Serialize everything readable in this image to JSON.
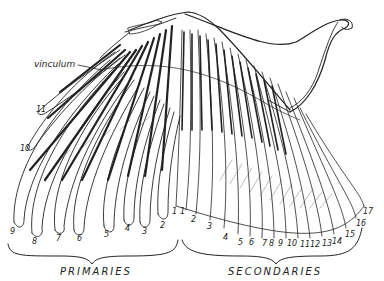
{
  "figure": {
    "line_color": "#222222",
    "background": "#ffffff"
  },
  "labels": {
    "vinculum": "vinculum",
    "primaries_group": "PRIMARIES",
    "secondaries_group": "SECONDARIES"
  },
  "primaries": [
    {
      "n": "1",
      "x": 174,
      "y": 210
    },
    {
      "n": "2",
      "x": 162,
      "y": 224
    },
    {
      "n": "3",
      "x": 143,
      "y": 230
    },
    {
      "n": "4",
      "x": 126,
      "y": 227
    },
    {
      "n": "5",
      "x": 105,
      "y": 233
    },
    {
      "n": "6",
      "x": 78,
      "y": 237
    },
    {
      "n": "7",
      "x": 57,
      "y": 237
    },
    {
      "n": "8",
      "x": 33,
      "y": 240
    },
    {
      "n": "9",
      "x": 11,
      "y": 230
    },
    {
      "n": "10",
      "x": 22,
      "y": 147
    },
    {
      "n": "11",
      "x": 37,
      "y": 108
    }
  ],
  "secondaries": [
    {
      "n": "1",
      "x": 181,
      "y": 210
    },
    {
      "n": "2",
      "x": 192,
      "y": 218
    },
    {
      "n": "3",
      "x": 208,
      "y": 225
    },
    {
      "n": "4",
      "x": 224,
      "y": 236
    },
    {
      "n": "5",
      "x": 239,
      "y": 241
    },
    {
      "n": "6",
      "x": 250,
      "y": 241
    },
    {
      "n": "7",
      "x": 264,
      "y": 242
    },
    {
      "n": "8",
      "x": 271,
      "y": 242
    },
    {
      "n": "9",
      "x": 280,
      "y": 242
    },
    {
      "n": "10",
      "x": 290,
      "y": 242
    },
    {
      "n": "11",
      "x": 302,
      "y": 243
    },
    {
      "n": "12",
      "x": 312,
      "y": 243
    },
    {
      "n": "13",
      "x": 324,
      "y": 242
    },
    {
      "n": "14",
      "x": 334,
      "y": 240
    },
    {
      "n": "15",
      "x": 347,
      "y": 233
    },
    {
      "n": "16",
      "x": 358,
      "y": 222
    },
    {
      "n": "17",
      "x": 365,
      "y": 210
    }
  ]
}
